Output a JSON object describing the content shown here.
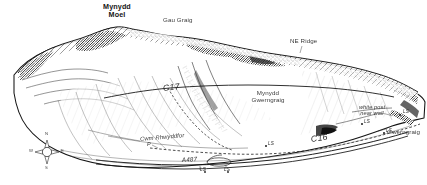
{
  "figure": {
    "kind": "field-sketch-panorama",
    "ink_color": "#1a1a1a",
    "paper_color": "#ffffff"
  },
  "labels": {
    "mynydd_moel_line1": "Mynydd",
    "mynydd_moel_line2": "Moel",
    "gau_graig": "Gau Graig",
    "ne_ridge": "NE Ridge",
    "mynydd_gwerngraig_line1": "Mynydd",
    "mynydd_gwerngraig_line2": "Gwerngraig",
    "gwerngraig": "Gwerngraig",
    "cwm_rhwyddfor": "Cwm Rhwyddfor",
    "white_post_line1": "white post",
    "white_post_line2": "near wall",
    "code_c17": "C17",
    "code_c16": "C16",
    "road_a487": "A487",
    "parking_p": "P",
    "ls_1": "LS",
    "ls_2": "LS",
    "ls_3": "LS",
    "ls_4": "LS",
    "ls_5": "LS",
    "ls_6": "LS"
  },
  "compass": {
    "north": "N",
    "south": "S",
    "east": "E",
    "west": "W"
  }
}
